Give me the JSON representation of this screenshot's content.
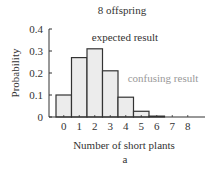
{
  "chart_data": {
    "type": "bar",
    "title": "8 offspring",
    "subtitle": "a",
    "xlabel": "Number of short plants",
    "ylabel": "Probability",
    "categories": [
      "0",
      "1",
      "2",
      "3",
      "4",
      "5",
      "6",
      "7",
      "8"
    ],
    "values": [
      0.1,
      0.27,
      0.31,
      0.21,
      0.09,
      0.026,
      0.004,
      0.0004,
      2e-05
    ],
    "ylim": [
      0,
      0.4
    ],
    "yticks": [
      "0",
      "0.1",
      "0.2",
      "0.3",
      "0.4"
    ],
    "grid": false,
    "annotations": [
      {
        "text": "expected result",
        "color": "#333333"
      },
      {
        "text": "confusing result",
        "color": "#999999"
      }
    ],
    "colors": {
      "bar_fill": "#ececec",
      "bar_stroke": "#333333",
      "axis": "#333333",
      "text": "#333333",
      "muted_text": "#999999"
    }
  }
}
